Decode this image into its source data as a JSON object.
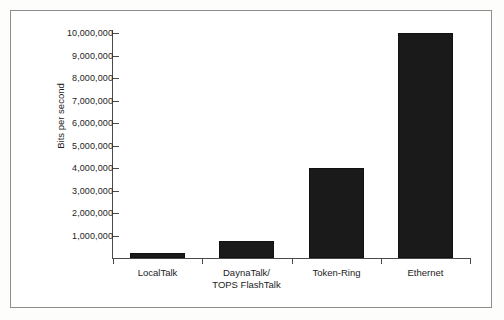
{
  "figure": {
    "background_color": "#ffffff",
    "frame_color": "#8d8d8d",
    "axis_color": "#4a4a4a",
    "bar_color": "#1a1a1a",
    "text_color": "#1d1d1d"
  },
  "chart_data": {
    "type": "bar",
    "title": "",
    "subtitle": "",
    "xlabel": "",
    "ylabel": "Bits per second",
    "categories": [
      "LocalTalk",
      "DaynaTalk/\nTOPS FlashTalk",
      "Token-Ring",
      "Ethernet"
    ],
    "category_lines": [
      [
        "LocalTalk"
      ],
      [
        "DaynaTalk/",
        "TOPS FlashTalk"
      ],
      [
        "Token-Ring"
      ],
      [
        "Ethernet"
      ]
    ],
    "values": [
      230000,
      770000,
      4000000,
      10000000
    ],
    "value_labels": [
      "230,000",
      "770,000",
      "4,000,000",
      "10,000,000"
    ],
    "ylim": [
      0,
      10000000
    ],
    "ytick_values": [
      1000000,
      2000000,
      3000000,
      4000000,
      5000000,
      6000000,
      7000000,
      8000000,
      9000000,
      10000000
    ],
    "ytick_labels": [
      "1,000,000",
      "2,000,000",
      "3,000,000",
      "4,000,000",
      "5,000,000",
      "6,000,000",
      "7,000,000",
      "8,000,000",
      "9,000,000",
      "10,000,000"
    ],
    "grid": false,
    "legend": false,
    "legend_position": "none",
    "orientation": "vertical"
  }
}
